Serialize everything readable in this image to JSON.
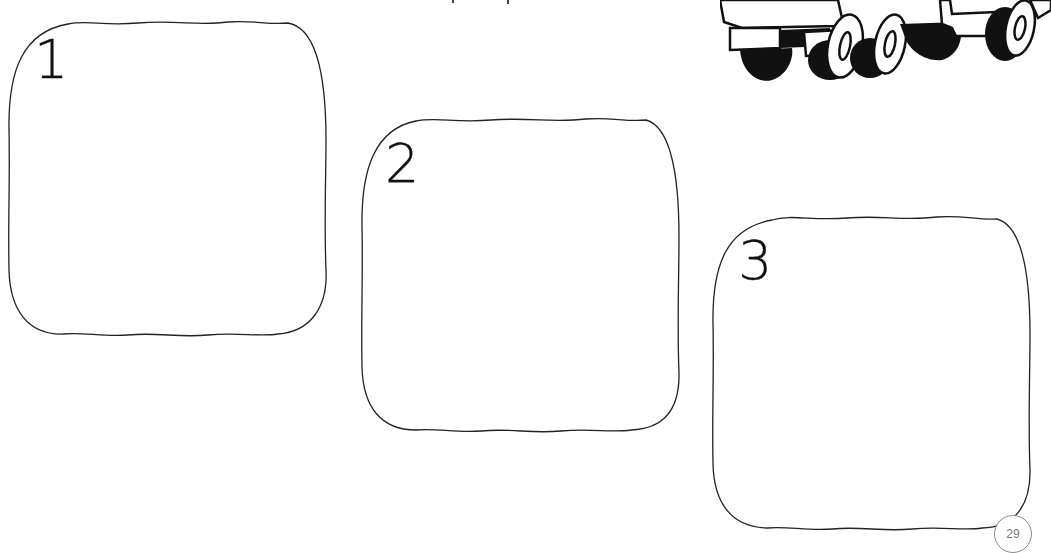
{
  "document": {
    "type": "storyboard worksheet",
    "page_number": "29",
    "frames": [
      {
        "number": "1"
      },
      {
        "number": "2"
      },
      {
        "number": "3"
      }
    ],
    "illustration": "truck-drawing",
    "colors": {
      "background": "#ffffff",
      "ink": "#111111",
      "page_number_ring": "#8a8a8a",
      "page_number_text": "#777777"
    }
  }
}
